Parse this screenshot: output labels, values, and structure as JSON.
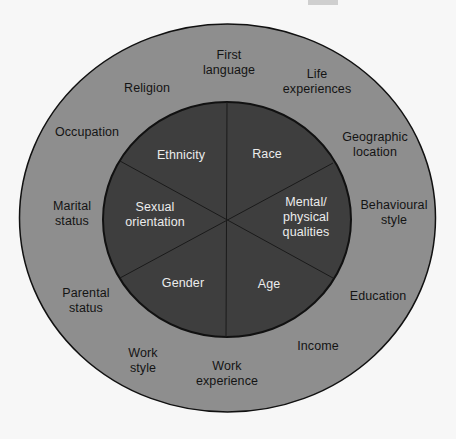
{
  "diagram": {
    "type": "concentric-wheel",
    "colors": {
      "background": "#f7f7f7",
      "outer_ring": "#8e8e8e",
      "inner_circle": "#3e3e3e",
      "outline": "#111111",
      "outer_text": "#141414",
      "inner_text": "#ececec"
    },
    "inner_core": {
      "label": "Primary dimensions",
      "segments": [
        {
          "id": "race",
          "label": "Race"
        },
        {
          "id": "mental-physical",
          "label": "Mental/\nphysical\nqualities"
        },
        {
          "id": "age",
          "label": "Age"
        },
        {
          "id": "gender",
          "label": "Gender"
        },
        {
          "id": "sexual-orientation",
          "label": "Sexual\norientation"
        },
        {
          "id": "ethnicity",
          "label": "Ethnicity"
        }
      ]
    },
    "outer_ring": {
      "label": "Secondary dimensions",
      "items": [
        {
          "id": "first-language",
          "label": "First\nlanguage"
        },
        {
          "id": "life-experiences",
          "label": "Life\nexperiences"
        },
        {
          "id": "geographic-location",
          "label": "Geographic\nlocation"
        },
        {
          "id": "behavioural-style",
          "label": "Behavioural\nstyle"
        },
        {
          "id": "education",
          "label": "Education"
        },
        {
          "id": "income",
          "label": "Income"
        },
        {
          "id": "work-experience",
          "label": "Work\nexperience"
        },
        {
          "id": "work-style",
          "label": "Work\nstyle"
        },
        {
          "id": "parental-status",
          "label": "Parental\nstatus"
        },
        {
          "id": "marital-status",
          "label": "Marital\nstatus"
        },
        {
          "id": "occupation",
          "label": "Occupation"
        },
        {
          "id": "religion",
          "label": "Religion"
        }
      ]
    }
  }
}
